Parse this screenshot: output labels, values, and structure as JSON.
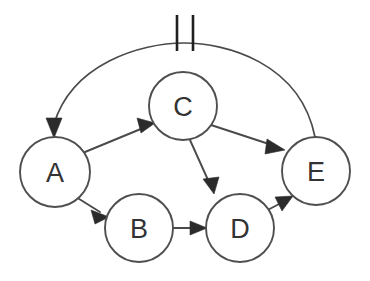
{
  "diagram": {
    "type": "directed-graph",
    "canvas": {
      "width": 370,
      "height": 281,
      "background": "#ffffff"
    },
    "style": {
      "node_fill": "#ffffff",
      "node_stroke": "#4f4f4f",
      "edge_stroke": "#4a4a4a",
      "arrow_fill": "#2b2b2b",
      "label_color": "#333333",
      "tick_color": "#1f1f1f"
    },
    "nodes": [
      {
        "id": "A",
        "label": "A",
        "cx": 55,
        "cy": 172,
        "r": 35
      },
      {
        "id": "B",
        "label": "B",
        "cx": 139,
        "cy": 228,
        "r": 34
      },
      {
        "id": "C",
        "label": "C",
        "cx": 183,
        "cy": 106,
        "r": 34
      },
      {
        "id": "D",
        "label": "D",
        "cx": 240,
        "cy": 228,
        "r": 34
      },
      {
        "id": "E",
        "label": "E",
        "cx": 316,
        "cy": 171,
        "r": 34
      }
    ],
    "edges": [
      {
        "id": "A-C",
        "from": "A",
        "to": "C",
        "shape": "straight",
        "directed": true,
        "marked": false
      },
      {
        "id": "A-B",
        "from": "A",
        "to": "B",
        "shape": "straight",
        "directed": true,
        "marked": false
      },
      {
        "id": "C-D",
        "from": "C",
        "to": "D",
        "shape": "straight",
        "directed": true,
        "marked": false
      },
      {
        "id": "C-E",
        "from": "C",
        "to": "E",
        "shape": "straight",
        "directed": true,
        "marked": false
      },
      {
        "id": "B-D",
        "from": "B",
        "to": "D",
        "shape": "straight",
        "directed": true,
        "marked": false
      },
      {
        "id": "D-E",
        "from": "D",
        "to": "E",
        "shape": "straight",
        "directed": true,
        "marked": false
      },
      {
        "id": "E-A",
        "from": "E",
        "to": "A",
        "shape": "arc",
        "directed": true,
        "marked": true,
        "mark_count": 2,
        "mark_type": "double-tick"
      }
    ]
  }
}
